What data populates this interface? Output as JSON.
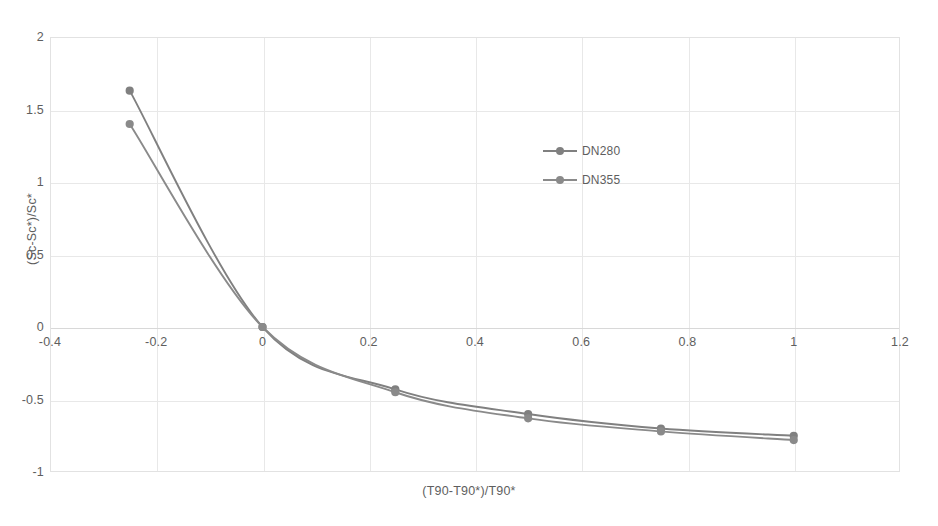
{
  "chart_data": {
    "type": "line",
    "title": "",
    "subtitle": "",
    "xlabel": "(T90-T90*)/T90*",
    "ylabel": "(Sc-Sc*)/Sc*",
    "xlim": [
      -0.4,
      1.2
    ],
    "ylim": [
      -1,
      2
    ],
    "xticks": [
      "-0.4",
      "-0.2",
      "0",
      "0.2",
      "0.4",
      "0.6",
      "0.8",
      "1",
      "1.2"
    ],
    "xtick_values": [
      -0.4,
      -0.2,
      0,
      0.2,
      0.4,
      0.6,
      0.8,
      1,
      1.2
    ],
    "yticks": [
      "2",
      "1.5",
      "1",
      "0.5",
      "0",
      "-0.5",
      "-1"
    ],
    "ytick_values": [
      2,
      1.5,
      1,
      0.5,
      0,
      -0.5,
      -1
    ],
    "grid": true,
    "legend_position": "inside-upper-center-right",
    "x": [
      -0.25,
      0,
      0.25,
      0.5,
      0.75,
      1
    ],
    "series": [
      {
        "name": "DN280",
        "color": "#808080",
        "marker": "circle",
        "values": [
          1.63,
          0,
          -0.43,
          -0.6,
          -0.7,
          -0.75
        ]
      },
      {
        "name": "DN355",
        "color": "#8a8a8a",
        "marker": "circle",
        "values": [
          1.4,
          0,
          -0.45,
          -0.63,
          -0.72,
          -0.78
        ]
      }
    ],
    "colors": {
      "series_1": "#808080",
      "series_2": "#8a8a8a",
      "gridline": "#e8e8e8",
      "plot_border": "#e2e2e2",
      "text": "#5e5e5e",
      "background": "#ffffff"
    }
  }
}
